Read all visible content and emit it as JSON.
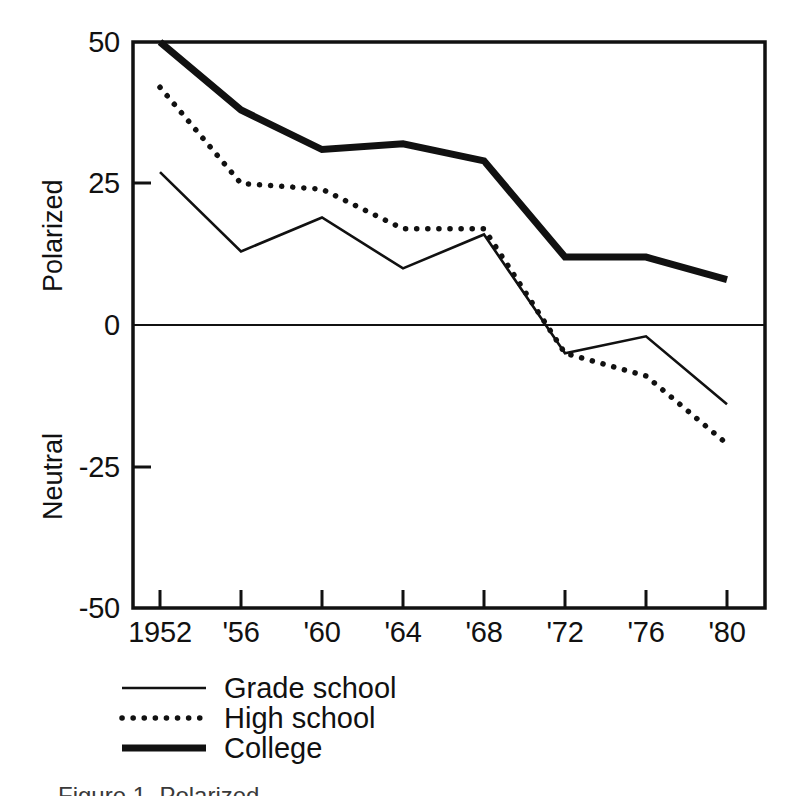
{
  "figure": {
    "caption": "Figure 1. Polarized",
    "background_color": "#ffffff",
    "ink_color": "#111111"
  },
  "axes": {
    "y_title_top": "Polarized",
    "y_title_bottom": "Neutral",
    "y_ticks": [
      "50",
      "25",
      "0",
      "-25",
      "-50"
    ],
    "y_tick_values": [
      50,
      25,
      0,
      -25,
      -50
    ],
    "x_ticks": [
      "1952",
      "'56",
      "'60",
      "'64",
      "'68",
      "'72",
      "'76",
      "'80"
    ]
  },
  "legend": {
    "position": "below-axis-left",
    "entries": [
      {
        "label": "Grade school",
        "style": "thin-solid",
        "swatch_name": "legend-swatch-grade-school"
      },
      {
        "label": "High school",
        "style": "dotted",
        "swatch_name": "legend-swatch-high-school"
      },
      {
        "label": "College",
        "style": "thick-solid",
        "swatch_name": "legend-swatch-college"
      }
    ]
  },
  "chart_data": {
    "type": "line",
    "title": "",
    "subtitle": "",
    "xlabel": "",
    "ylabel": "Polarized / Neutral",
    "x": [
      1952,
      1956,
      1960,
      1964,
      1968,
      1972,
      1976,
      1980
    ],
    "categories": [
      "1952",
      "'56",
      "'60",
      "'64",
      "'68",
      "'72",
      "'76",
      "'80"
    ],
    "xlim": [
      1952,
      1980
    ],
    "ylim": [
      -50,
      50
    ],
    "yticks": [
      -50,
      -25,
      0,
      25,
      50
    ],
    "grid": false,
    "zero_line": true,
    "legend_position": "bottom-left",
    "series": [
      {
        "name": "Grade school",
        "style": "thin-solid",
        "color": "#111111",
        "line_width": 2,
        "values": [
          27,
          13,
          19,
          10,
          16,
          -5,
          -2,
          -14
        ]
      },
      {
        "name": "High school",
        "style": "dotted",
        "color": "#111111",
        "line_width": 5,
        "values": [
          42,
          25,
          24,
          17,
          17,
          -5,
          -9,
          -21
        ]
      },
      {
        "name": "College",
        "style": "thick-solid",
        "color": "#111111",
        "line_width": 7,
        "values": [
          50,
          38,
          31,
          32,
          29,
          12,
          12,
          8
        ]
      }
    ],
    "annotations": [
      "Grade school and High school lines overlap between 1968 and 1972",
      "Zero line drawn across the plot at value 0"
    ]
  }
}
